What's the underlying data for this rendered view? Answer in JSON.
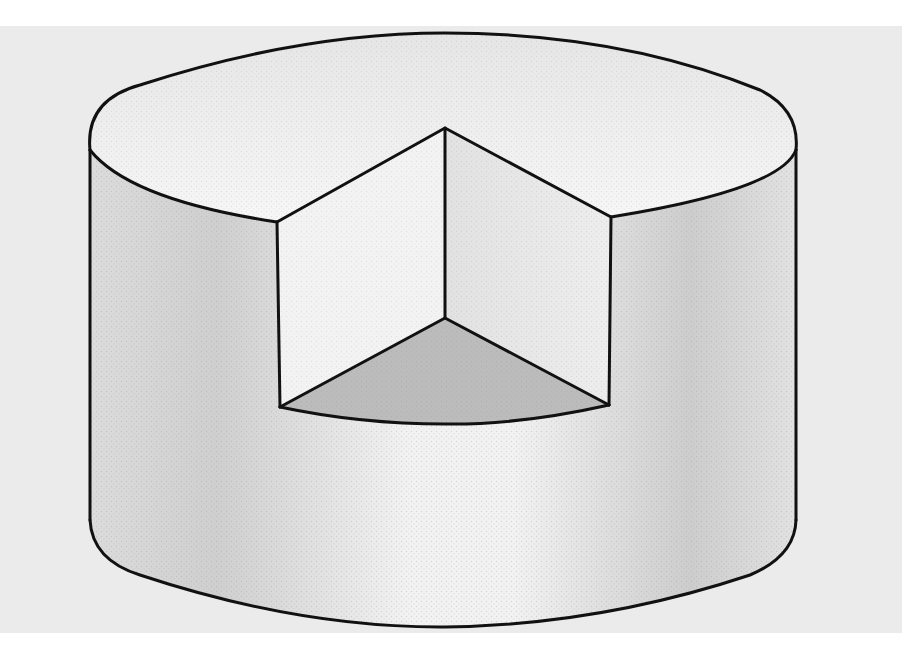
{
  "figure": {
    "colors": {
      "paper": "#ebebeb",
      "outline": "#111111",
      "top_face": "#f4f4f4",
      "side_light": "#f1f1f1",
      "side_shade": "#d2d2d2",
      "inner_face": "#f2f2f2",
      "sector_floor": "#b9b9b9"
    }
  }
}
